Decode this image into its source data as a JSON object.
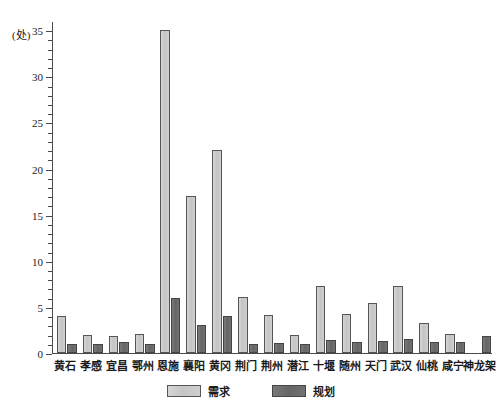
{
  "chart_data": {
    "type": "bar",
    "title": "",
    "xlabel": "",
    "ylabel": "(处)",
    "ylim": [
      0,
      36
    ],
    "ytick_major_step": 5,
    "ytick_minor_step": 1,
    "yticks": [
      0,
      5,
      10,
      15,
      20,
      25,
      30,
      35
    ],
    "ytick_labels": [
      "0",
      "5",
      "10",
      "15",
      "20",
      "25",
      "30",
      "35"
    ],
    "grid": false,
    "legend_position": "bottom-center",
    "categories": [
      "黄石",
      "孝感",
      "宜昌",
      "鄂州",
      "恩施",
      "襄阳",
      "黄冈",
      "荆门",
      "荆州",
      "潜江",
      "十堰",
      "随州",
      "天门",
      "武汉",
      "仙桃",
      "咸宁",
      "神龙架"
    ],
    "series": [
      {
        "name": "需求",
        "color": "#c9c9c9",
        "values": [
          4,
          1.9,
          1.8,
          2.1,
          35,
          17,
          22,
          6.1,
          4.1,
          2,
          7.3,
          4.2,
          5.4,
          7.3,
          3.3,
          2.1,
          0
        ]
      },
      {
        "name": "规划",
        "color": "#6e6e6e",
        "values": [
          1,
          1,
          1.2,
          1,
          6,
          3,
          4,
          1,
          1.1,
          1,
          1.4,
          1.2,
          1.3,
          1.5,
          1.2,
          1.2,
          1.8
        ]
      }
    ]
  },
  "axis": {
    "y_unit_label": "(处)"
  },
  "legend": {
    "items": [
      {
        "label": "需求",
        "swatch": "demand"
      },
      {
        "label": "规划",
        "swatch": "plan"
      }
    ]
  }
}
